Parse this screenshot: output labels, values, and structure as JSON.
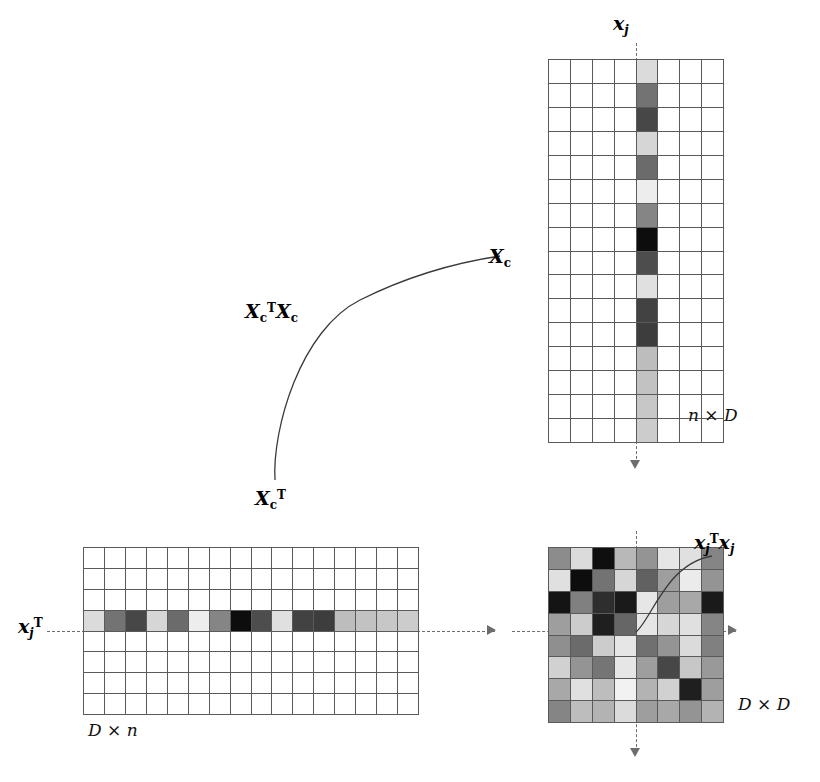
{
  "figure": {
    "labels": {
      "column_vector": "x",
      "column_vector_sub": "j",
      "row_vector": "x",
      "row_vector_sub": "j",
      "row_vector_sup": "T",
      "product_cell": "x",
      "product_cell_sub": "j",
      "product_cell_sup": "T",
      "matrix_Xc": "X",
      "matrix_Xc_sub": "c",
      "matrix_XcT": "X",
      "matrix_XcT_sub": "c",
      "matrix_XcT_sup": "T",
      "product_label_main": "X",
      "dims_top_right": "n × D",
      "dims_bottom_left": "D × n",
      "dims_bottom_right": "D × D"
    },
    "text": {
      "xj": "xj",
      "xjT": "xjT",
      "xjTxj": "xjTxj",
      "Xc": "Xc",
      "XcT": "XcT",
      "XcTXc": "XcTXc",
      "n_times_D": "n × D",
      "D_times_n": "D × n",
      "D_times_D": "D × D"
    },
    "colors": {
      "grid_line": "#5a5a5a",
      "guide_line": "#6d6d6d",
      "background": "#ffffff",
      "text": "#000000"
    }
  },
  "chart_data": {
    "type": "heatmap",
    "matrices": [
      {
        "name": "Xc",
        "dims_label": "n × D",
        "rows": 16,
        "cols": 8,
        "highlight_type": "column",
        "highlight_index": 4,
        "highlight_label": "xj",
        "column_values": [
          0.86,
          0.45,
          0.28,
          0.84,
          0.42,
          0.93,
          0.52,
          0.05,
          0.3,
          0.88,
          0.26,
          0.24,
          0.74,
          0.76,
          0.78,
          0.8
        ]
      },
      {
        "name": "XcT",
        "dims_label": "D × n",
        "rows": 8,
        "cols": 16,
        "highlight_type": "row",
        "highlight_index": 3,
        "highlight_label": "xjT",
        "row_values": [
          0.86,
          0.45,
          0.28,
          0.84,
          0.42,
          0.93,
          0.52,
          0.05,
          0.3,
          0.88,
          0.26,
          0.24,
          0.74,
          0.76,
          0.78,
          0.8
        ]
      },
      {
        "name": "XcTXc",
        "dims_label": "D × D",
        "rows": 8,
        "cols": 8,
        "highlight_type": "cell",
        "highlight_row": 3,
        "highlight_col": 4,
        "highlight_label": "xjTxj",
        "values": [
          [
            0.55,
            0.86,
            0.06,
            0.72,
            0.58,
            0.9,
            0.88,
            0.52
          ],
          [
            0.88,
            0.05,
            0.45,
            0.84,
            0.38,
            0.62,
            0.92,
            0.58
          ],
          [
            0.08,
            0.5,
            0.18,
            0.1,
            0.9,
            0.62,
            0.66,
            0.1
          ],
          [
            0.62,
            0.8,
            0.12,
            0.4,
            0.9,
            0.84,
            0.88,
            0.52
          ],
          [
            0.56,
            0.42,
            0.8,
            0.9,
            0.44,
            0.58,
            0.86,
            0.5
          ],
          [
            0.82,
            0.58,
            0.46,
            0.9,
            0.62,
            0.28,
            0.78,
            0.6
          ],
          [
            0.66,
            0.88,
            0.74,
            0.95,
            0.7,
            0.82,
            0.12,
            0.62
          ],
          [
            0.52,
            0.74,
            0.7,
            0.86,
            0.62,
            0.66,
            0.58,
            0.7
          ]
        ]
      }
    ],
    "grid": true,
    "legend": "none",
    "colormap": "grayscale",
    "colormap_note": "value 0 = black, value 1 = white"
  }
}
